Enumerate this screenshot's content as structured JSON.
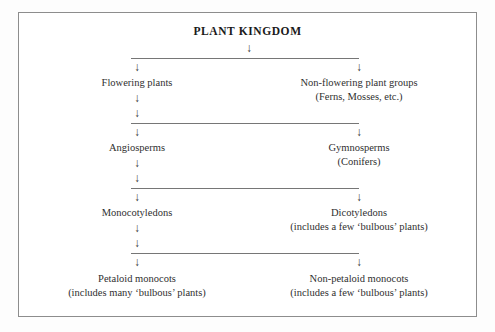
{
  "diagram": {
    "title": "PLANT KINGDOM",
    "frame_color": "#8d8d8d",
    "line_color": "#767676",
    "text_color": "#2f2f2f",
    "arrow_glyph": "↓",
    "levels": [
      {
        "level": 1,
        "nodes": [
          {
            "label": "Flowering plants",
            "sub": "",
            "column": "left"
          },
          {
            "label": "Non-flowering plant groups",
            "sub": "(Ferns, Mosses, etc.)",
            "column": "right"
          }
        ]
      },
      {
        "level": 2,
        "nodes": [
          {
            "label": "Angiosperms",
            "sub": "",
            "column": "left"
          },
          {
            "label": "Gymnosperms",
            "sub": "(Conifers)",
            "column": "right"
          }
        ]
      },
      {
        "level": 3,
        "nodes": [
          {
            "label": "Monocotyledons",
            "sub": "",
            "column": "left"
          },
          {
            "label": "Dicotyledons",
            "sub": "(includes a few ‘bulbous’ plants)",
            "column": "right"
          }
        ]
      },
      {
        "level": 4,
        "nodes": [
          {
            "label": "Petaloid monocots",
            "sub": "(includes many ‘bulbous’ plants)",
            "column": "left"
          },
          {
            "label": "Non-petaloid monocots",
            "sub": "(includes a few ‘bulbous’ plants)",
            "column": "right"
          }
        ]
      }
    ],
    "arrows": {
      "title_down": "↓",
      "branch_left": "↓",
      "branch_right": "↓",
      "chain": "↓"
    }
  }
}
